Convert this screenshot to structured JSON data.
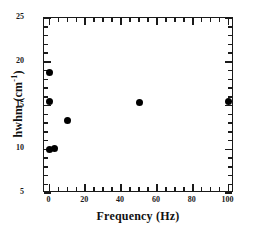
{
  "chart_data": {
    "type": "scatter",
    "title": "",
    "xlabel": "Frequency (Hz)",
    "ylabel_main": "hwhm (cm",
    "ylabel_sup": "-1",
    "ylabel_close": ")",
    "ylabel_full": "hwhm (cm-1)",
    "xlim": [
      -3,
      103
    ],
    "ylim": [
      5,
      25
    ],
    "xticks": [
      0,
      20,
      40,
      60,
      80,
      100
    ],
    "xtick_labels": [
      "0",
      "20",
      "40",
      "60",
      "80",
      "100"
    ],
    "yticks": [
      5,
      10,
      15,
      20,
      25
    ],
    "ytick_labels": [
      "5",
      "10",
      "15",
      "20",
      "25"
    ],
    "x_minor_interval": 5,
    "y_minor_interval": 1,
    "grid": false,
    "legend": null,
    "marker": "filled-circle",
    "marker_color": "#000000",
    "marker_size_px": 7,
    "points": [
      {
        "x": 0.0,
        "y": 18.8
      },
      {
        "x": 0.0,
        "y": 15.5
      },
      {
        "x": 10.0,
        "y": 13.3
      },
      {
        "x": 0.3,
        "y": 10.0
      },
      {
        "x": 3.0,
        "y": 10.1
      },
      {
        "x": 50.0,
        "y": 15.4
      },
      {
        "x": 100.0,
        "y": 15.5
      }
    ]
  }
}
